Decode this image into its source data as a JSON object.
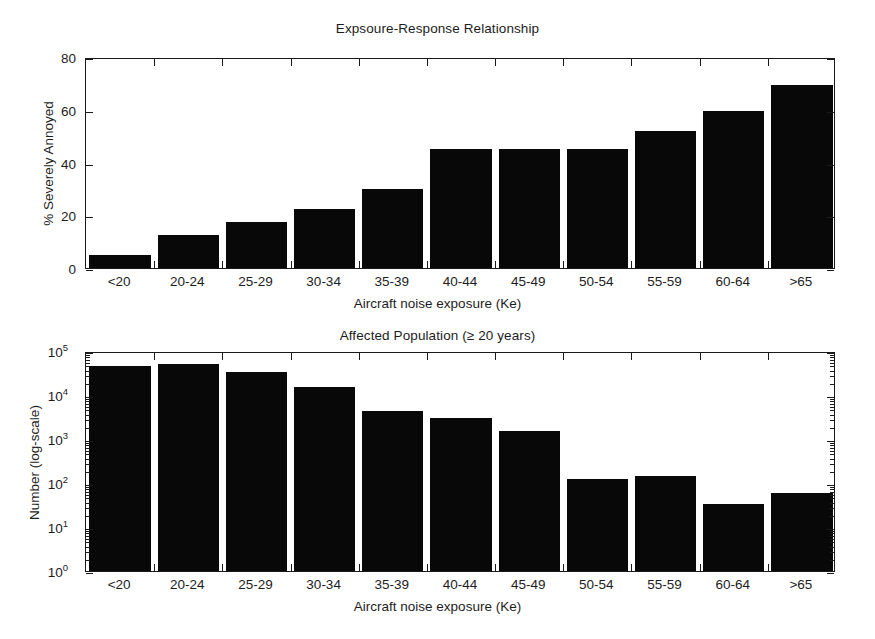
{
  "figure": {
    "background": "#ffffff",
    "bar_color": "#080808",
    "axis_color": "#1a1a1a"
  },
  "chart_data": [
    {
      "type": "bar",
      "id": "exposure-response",
      "title": "Expsoure-Response Relationship",
      "xlabel": "Aircraft noise exposure (Ke)",
      "ylabel": "% Severely Annoyed",
      "categories": [
        "<20",
        "20-24",
        "25-29",
        "30-34",
        "35-39",
        "40-44",
        "45-49",
        "50-54",
        "55-59",
        "60-64",
        ">65"
      ],
      "values": [
        5,
        12.5,
        17.5,
        22.5,
        30,
        45,
        45,
        45,
        52,
        59.5,
        69.5
      ],
      "ytick_labels": [
        "0",
        "20",
        "40",
        "60",
        "80"
      ],
      "ytick_values": [
        0,
        20,
        40,
        60,
        80
      ],
      "ylim": [
        0,
        80
      ],
      "yscale": "linear",
      "grid": false,
      "legend": "none"
    },
    {
      "type": "bar",
      "id": "affected-population",
      "title": "Affected Population (≥ 20 years)",
      "xlabel": "Aircraft noise exposure (Ke)",
      "ylabel": "Number (log-scale)",
      "categories": [
        "<20",
        "20-24",
        "25-29",
        "30-34",
        "35-39",
        "40-44",
        "45-49",
        "50-54",
        "55-59",
        "60-64",
        ">65"
      ],
      "values": [
        45000,
        50000,
        33000,
        15000,
        4300,
        3000,
        1550,
        125,
        145,
        34,
        58
      ],
      "ytick_labels": [
        "10⁰",
        "10¹",
        "10²",
        "10³",
        "10⁴",
        "10⁵"
      ],
      "ytick_mantissas": [
        "10",
        "10",
        "10",
        "10",
        "10",
        "10"
      ],
      "ytick_exponents": [
        "0",
        "1",
        "2",
        "3",
        "4",
        "5"
      ],
      "ytick_values": [
        1,
        10,
        100,
        1000,
        10000,
        100000
      ],
      "ylim": [
        1,
        100000
      ],
      "yscale": "log",
      "grid": false,
      "legend": "none"
    }
  ]
}
